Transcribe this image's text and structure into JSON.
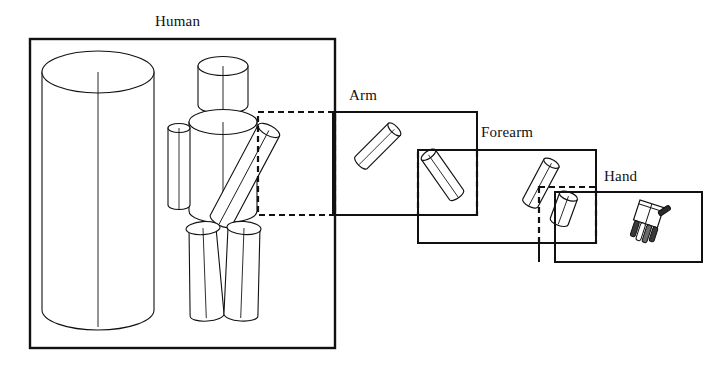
{
  "figure": {
    "type": "diagram",
    "background_color": "#ffffff",
    "line_color": "#111111",
    "levels": [
      {
        "id": "human",
        "label": "Human",
        "order": 1,
        "box": {
          "x": 30,
          "y": 39,
          "width": 305,
          "height": 309
        },
        "label_position": "top-center",
        "dashed_region": {
          "x": 258,
          "y": 112,
          "width": 77,
          "height": 103
        },
        "parts": [
          "large-background-cylinder",
          "head-cylinder",
          "torso-cylinder",
          "left-arm-cylinder",
          "right-upper-arm-cylinder",
          "left-leg-cylinder",
          "right-leg-cylinder"
        ]
      },
      {
        "id": "arm",
        "label": "Arm",
        "order": 2,
        "box": {
          "x": 333,
          "y": 112,
          "width": 144,
          "height": 103
        },
        "label_position": "top-left",
        "dashed_region": {
          "x": 418,
          "y": 150,
          "width": 59,
          "height": 65
        },
        "parts": [
          "upper-arm-cylinder",
          "forearm-cylinder"
        ]
      },
      {
        "id": "forearm",
        "label": "Forearm",
        "order": 3,
        "box": {
          "x": 418,
          "y": 150,
          "width": 178,
          "height": 93
        },
        "label_position": "top-left",
        "dashed_region": {
          "x": 539,
          "y": 187,
          "width": 57,
          "height": 56
        },
        "parts": [
          "forearm-cylinder",
          "hand-block"
        ]
      },
      {
        "id": "hand",
        "label": "Hand",
        "order": 4,
        "box": {
          "x": 555,
          "y": 192,
          "width": 147,
          "height": 70
        },
        "label_position": "top-left",
        "dashed_region": null,
        "parts": [
          "palm-block",
          "finger-1",
          "finger-2",
          "finger-3",
          "finger-4",
          "thumb"
        ]
      }
    ],
    "connectors": [
      {
        "from": "human",
        "to": "arm",
        "style": "solid-bracket"
      },
      {
        "from": "arm",
        "to": "forearm",
        "style": "solid-bracket"
      },
      {
        "from": "forearm",
        "to": "hand",
        "style": "solid-bracket"
      }
    ],
    "labels": {
      "human": "Human",
      "arm": "Arm",
      "forearm": "Forearm",
      "hand": "Hand"
    }
  }
}
